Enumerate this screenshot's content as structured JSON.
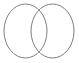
{
  "canvas": {
    "width": 79,
    "height": 63,
    "background_color": "#ffffff"
  },
  "figure": {
    "name": "two-overlapping-circles",
    "stroke_color": "#808080",
    "stroke_width": 1,
    "fill": "none"
  },
  "shapes": [
    {
      "id": "left-circle",
      "label": "Left circle",
      "cx": 25.5,
      "cy": 31,
      "rx": 21.5,
      "ry": 27,
      "stroke_color": "#808080",
      "stroke_width": 1,
      "fill": "none"
    },
    {
      "id": "right-circle",
      "label": "Right circle",
      "cx": 52.5,
      "cy": 31,
      "rx": 21.5,
      "ry": 27,
      "stroke_color": "#7d7d7d",
      "stroke_width": 1,
      "fill": "none"
    }
  ],
  "intersection": {
    "label": "Overlap region",
    "top_point_x": 39,
    "top_point_y": 9,
    "bottom_point_x": 39,
    "bottom_point_y": 53
  }
}
